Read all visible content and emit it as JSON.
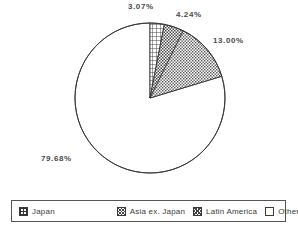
{
  "chart_data": {
    "type": "pie",
    "title": "",
    "subtitle": "",
    "xlabel": "",
    "ylabel": "",
    "legend_position": "bottom",
    "grid": false,
    "start_angle_deg": 0,
    "direction": "clockwise",
    "categories": [
      "Japan",
      "Asia ex. Japan",
      "Latin America",
      "Other"
    ],
    "values": [
      3.07,
      4.24,
      13.0,
      79.68
    ],
    "value_labels": [
      "3.07%",
      "4.24%",
      "13.00%",
      "79.68%"
    ],
    "slices": [
      {
        "name": "Japan",
        "value": 3.07,
        "label": "3.07%",
        "pattern": "grid"
      },
      {
        "name": "Asia ex. Japan",
        "value": 4.24,
        "label": "4.24%",
        "pattern": "checker"
      },
      {
        "name": "Latin America",
        "value": 13.0,
        "label": "13.00%",
        "pattern": "diagonal"
      },
      {
        "name": "Other",
        "value": 79.68,
        "label": "79.68%",
        "pattern": "empty"
      }
    ]
  },
  "labels": {
    "japan": "3.07%",
    "asia": "4.24%",
    "latam": "13.00%",
    "other": "79.68%"
  },
  "legend": {
    "items": [
      {
        "label": "Japan",
        "swatch": "grid-swatch"
      },
      {
        "label": "Asia ex. Japan",
        "swatch": "checker-swatch"
      },
      {
        "label": "Latin America",
        "swatch": "diagonal-swatch"
      },
      {
        "label": "Other",
        "swatch": "empty-swatch"
      }
    ]
  },
  "colors": {
    "background": "#ffffff",
    "outline": "#333333",
    "label_text": "#4a4a4a",
    "legend_text": "#3a3a3a",
    "legend_border": "#555555"
  }
}
